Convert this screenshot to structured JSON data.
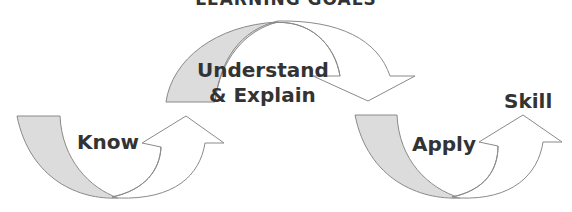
{
  "diagram": {
    "title": "LEARNING GOALS",
    "stages": [
      {
        "label": "Know"
      },
      {
        "label_line1": "Understand",
        "label_line2": "& Explain"
      },
      {
        "label": "Apply"
      }
    ],
    "outcome": "Skill",
    "colors": {
      "fill_gray": "#dcdcdc",
      "outline": "#8a8a8a",
      "text": "#333333"
    }
  }
}
